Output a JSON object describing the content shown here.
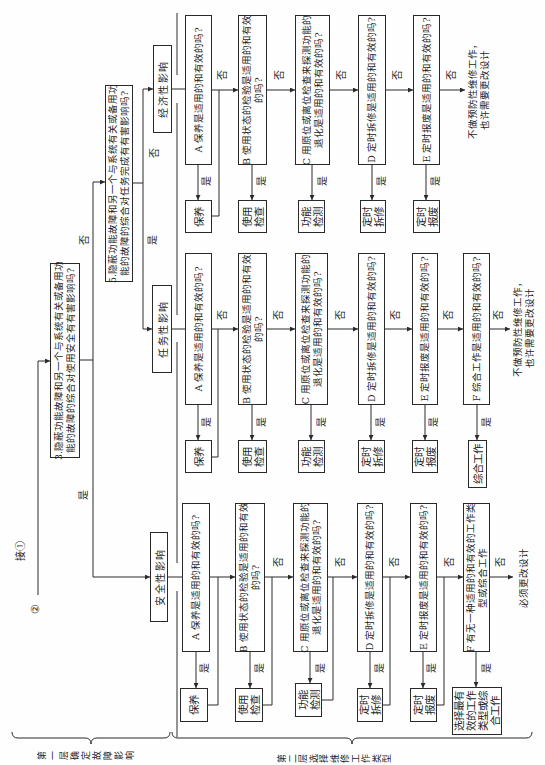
{
  "figure": {
    "entry": {
      "circle_label": "②",
      "connect_label": "接①"
    },
    "question_3": {
      "text": "3.隐蔽功能故障和另一个与系统有关或备用功\n能的故障的综合对使用安全有有害影响吗?",
      "yes_label": "是",
      "no_label": "否"
    },
    "question_5": {
      "text": "5.隐蔽功能故障和另一个与系统有关或备用功\n能的故障的综合对任务完成有有害影响吗?",
      "yes_label": "是",
      "no_label": "否"
    },
    "branches": {
      "safety": {
        "title": "安全性影响",
        "questions": [
          {
            "text": "A 保养是适用的和有效的吗?",
            "yes_label": "是",
            "task": "保养"
          },
          {
            "text": "B 使用状态的检验是适用的和有效\n的吗?",
            "yes_label": "是",
            "no_label": "否",
            "task": "使用\n检查"
          },
          {
            "text": "C 用原位或离位检查来探测功能的\n退化是适用的和有效的吗?",
            "yes_label": "是",
            "no_label": "否",
            "task": "功能\n检测"
          },
          {
            "text": "D 定时拆修是适用的和有效的吗?",
            "yes_label": "是",
            "no_label": "否",
            "task": "定时\n拆修"
          },
          {
            "text": "E 定时报废是适用的和有效的吗?",
            "yes_label": "是",
            "no_label": "否",
            "task": "定时\n报废"
          },
          {
            "text": "F 有无一种适用的和有效的工作类\n型或综合工作",
            "yes_label": "是",
            "no_label": "否",
            "task": "选择最有\n效的工作\n类型或综\n合工作"
          }
        ],
        "outcome": "必须更改设计"
      },
      "mission": {
        "title": "任务性影响",
        "questions": [
          {
            "text": "A 保养是适用的和有效的吗?",
            "yes_label": "是",
            "no_label": "否",
            "task": "保养"
          },
          {
            "text": "B 使用状态的检验是适用的和有效\n的吗?",
            "yes_label": "是",
            "no_label": "否",
            "task": "使用\n检查"
          },
          {
            "text": "C 用原位或离位检查来探测功能的\n退化是适用的和有效的吗?",
            "yes_label": "是",
            "no_label": "否",
            "task": "功能\n检测"
          },
          {
            "text": "D 定时拆修是适用的和有效的吗?",
            "yes_label": "是",
            "no_label": "否",
            "task": "定时\n拆修"
          },
          {
            "text": "E 定时报废是适用的和有效的吗?",
            "yes_label": "是",
            "no_label": "否",
            "task": "定时\n报废"
          },
          {
            "text": "F 综合工作是适用的和有效的吗?",
            "yes_label": "是",
            "no_label": "否",
            "task": "综合工作"
          }
        ],
        "outcome": "不做预防性维修工作，\n也许需要更改设计"
      },
      "economic": {
        "title": "经济性影响",
        "questions": [
          {
            "text": "A 保养是适用的和有效的吗?",
            "yes_label": "是",
            "no_label": "否",
            "task": "保养"
          },
          {
            "text": "B 使用状态的检验是适用的和有效\n的吗?",
            "yes_label": "是",
            "no_label": "否",
            "task": "使用\n检查"
          },
          {
            "text": "C 用原位或离位检查来探测功能的\n退化是适用的和有效的吗?",
            "yes_label": "是",
            "no_label": "否",
            "task": "功能\n检测"
          },
          {
            "text": "D 定时拆修是适用的和有效的吗?",
            "yes_label": "是",
            "no_label": "否",
            "task": "定时\n拆修"
          },
          {
            "text": "E 定时报废是适用的和有效的吗?",
            "yes_label": "是",
            "no_label": "否",
            "task": "定时\n报废"
          }
        ],
        "outcome": "不做预防性维修工作，\n也许需要更改设计"
      }
    },
    "layers": [
      {
        "label": "第一层确定故障影响"
      },
      {
        "label": "第二层选择维修工作类型"
      }
    ]
  }
}
